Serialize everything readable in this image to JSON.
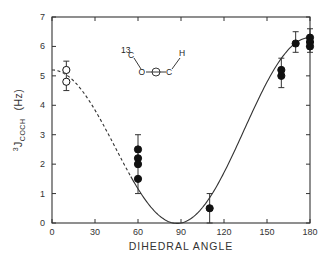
{
  "chart_data": {
    "type": "scatter",
    "title": "",
    "xlabel": "DIHEDRAL ANGLE",
    "ylabel": "3J COCH (Hz)",
    "ylabel_parts": {
      "superscript": "3",
      "main": "J",
      "subscript": "COCH",
      "unit": "(Hz)"
    },
    "xlim": [
      0,
      180
    ],
    "ylim": [
      0,
      7
    ],
    "x_ticks": [
      0,
      30,
      60,
      90,
      120,
      150,
      180
    ],
    "y_ticks": [
      0,
      1,
      2,
      3,
      4,
      5,
      6,
      7
    ],
    "grid": false,
    "legend": null,
    "series": [
      {
        "name": "open circles",
        "marker": "open-circle",
        "points": [
          {
            "x": 10,
            "y": 5.2
          },
          {
            "x": 10,
            "y": 4.8
          }
        ],
        "error_bars": [
          {
            "x": 10,
            "low": 4.5,
            "high": 5.5
          }
        ]
      },
      {
        "name": "filled circles",
        "marker": "filled-circle",
        "points": [
          {
            "x": 60,
            "y": 2.5
          },
          {
            "x": 60,
            "y": 2.2
          },
          {
            "x": 60,
            "y": 2.0
          },
          {
            "x": 60,
            "y": 1.5
          },
          {
            "x": 110,
            "y": 0.5
          },
          {
            "x": 160,
            "y": 5.2
          },
          {
            "x": 160,
            "y": 5.0
          },
          {
            "x": 170,
            "y": 6.1
          },
          {
            "x": 180,
            "y": 6.3
          },
          {
            "x": 180,
            "y": 6.15
          },
          {
            "x": 180,
            "y": 6.0
          }
        ],
        "error_bars": [
          {
            "x": 60,
            "low": 1.0,
            "high": 3.0
          },
          {
            "x": 110,
            "low": 0.0,
            "high": 1.0
          },
          {
            "x": 160,
            "low": 4.6,
            "high": 5.6
          },
          {
            "x": 170,
            "low": 5.8,
            "high": 6.5
          },
          {
            "x": 180,
            "low": 5.8,
            "high": 6.6
          }
        ]
      }
    ],
    "curve": {
      "name": "Karplus fit",
      "equation": "J = A cos^2(theta) + B cos(theta) + C",
      "A": 5.75,
      "B": -0.55,
      "C": 0,
      "dashed_range": [
        0,
        55
      ],
      "solid_range": [
        55,
        180
      ]
    },
    "annotations": [
      {
        "type": "molecule-diagram",
        "labels": [
          "13C",
          "O",
          "C",
          "H"
        ],
        "text": "13C–O–C–H"
      }
    ]
  },
  "molecule": {
    "isotope": "13",
    "atom1": "C",
    "atom2": "O",
    "atom3": "C",
    "atom4": "H"
  }
}
